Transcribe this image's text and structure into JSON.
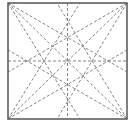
{
  "diagram": {
    "type": "geometric-construction",
    "colors": {
      "border": "#555555",
      "dashed": "#777777",
      "background": "#ffffff"
    },
    "square": {
      "x1": 8,
      "y1": 3,
      "x2": 127,
      "y2": 119
    },
    "dashed_lines": [
      {
        "name": "diagonal-tl-br",
        "x1": 8,
        "y1": 3,
        "x2": 127,
        "y2": 119
      },
      {
        "name": "diagonal-tr-bl",
        "x1": 127,
        "y1": 3,
        "x2": 8,
        "y2": 119
      },
      {
        "name": "vertical-midline",
        "x1": 67.5,
        "y1": 3,
        "x2": 67.5,
        "y2": 119
      },
      {
        "name": "horizontal-midline",
        "x1": 8,
        "y1": 61,
        "x2": 127,
        "y2": 61
      },
      {
        "name": "tl-to-right-upper",
        "x1": 8,
        "y1": 3,
        "x2": 127,
        "y2": 72
      },
      {
        "name": "tl-to-bottom-left",
        "x1": 8,
        "y1": 3,
        "x2": 80,
        "y2": 119
      },
      {
        "name": "tr-to-left-upper",
        "x1": 127,
        "y1": 3,
        "x2": 8,
        "y2": 72
      },
      {
        "name": "tr-to-bottom-right",
        "x1": 127,
        "y1": 3,
        "x2": 57,
        "y2": 119
      },
      {
        "name": "bl-to-top",
        "x1": 8,
        "y1": 119,
        "x2": 80,
        "y2": 3
      },
      {
        "name": "bl-to-right-lower",
        "x1": 8,
        "y1": 119,
        "x2": 127,
        "y2": 50
      },
      {
        "name": "br-to-top",
        "x1": 127,
        "y1": 119,
        "x2": 57,
        "y2": 3
      },
      {
        "name": "br-to-left-lower",
        "x1": 127,
        "y1": 119,
        "x2": 8,
        "y2": 50
      }
    ]
  }
}
